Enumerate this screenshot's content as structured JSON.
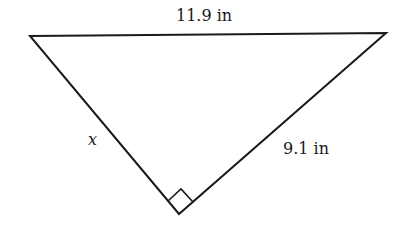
{
  "diagram": {
    "type": "right-triangle",
    "vertices": {
      "top_left": [
        30,
        36
      ],
      "top_right": [
        386,
        33
      ],
      "bottom": [
        179,
        214
      ]
    },
    "right_angle_at": "bottom",
    "labels": {
      "hypotenuse": "11.9 in",
      "left_leg": "x",
      "right_leg": "9.1 in"
    },
    "colors": {
      "stroke": "#1a1a1a",
      "background": "#ffffff"
    }
  }
}
